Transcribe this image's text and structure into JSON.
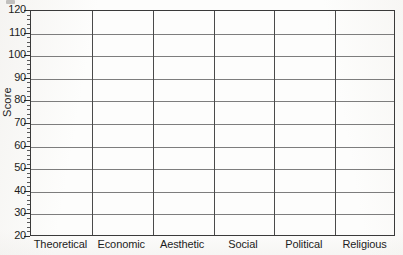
{
  "chart_data": {
    "type": "bar",
    "title": "",
    "subtitle": "",
    "xlabel": "",
    "ylabel": "Score",
    "categories": [
      "Theoretical",
      "Economic",
      "Aesthetic",
      "Social",
      "Political",
      "Religious"
    ],
    "series": [
      {
        "name": "Score",
        "values": [
          null,
          null,
          null,
          null,
          null,
          null
        ]
      }
    ],
    "values": [
      null,
      null,
      null,
      null,
      null,
      null
    ],
    "ylim": [
      20,
      120
    ],
    "ytick_step": 10,
    "yticks": [
      20,
      30,
      40,
      50,
      60,
      70,
      80,
      90,
      100,
      110,
      120
    ],
    "ytick_labels": [
      "20",
      "30",
      "40",
      "50",
      "60",
      "70",
      "80",
      "90",
      "100",
      "110",
      "120"
    ],
    "minor_tick_step": 2,
    "grid": true,
    "grid_axis": "both",
    "legend": false,
    "legend_position": "none",
    "annotations": [],
    "note": "Blank grid template - no data plotted"
  },
  "axes": {
    "y_title": "Score",
    "x_title": ""
  },
  "colors": {
    "background": "#fdfdfc",
    "frame": "#3a3a3a",
    "horizontal_gridline": "#7d7d7d",
    "vertical_gridline": "#4a4a4a",
    "text": "#1d1d1d",
    "tick_major": "#2f2f2f",
    "tick_minor": "#5a5a5a"
  }
}
